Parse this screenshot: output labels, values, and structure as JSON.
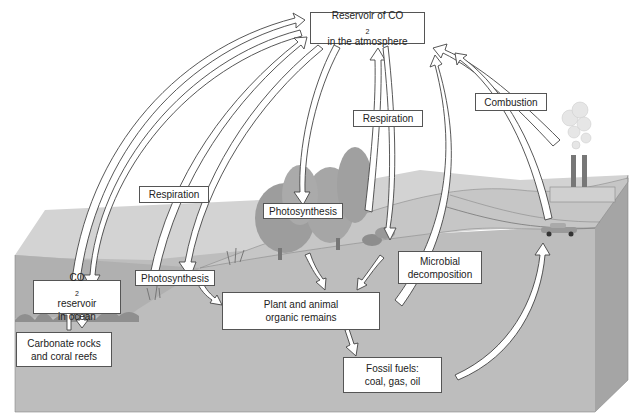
{
  "diagram": {
    "colors": {
      "background": "#ffffff",
      "ground_top": "#cfcfcf",
      "ground_front": "#bdbdbd",
      "ground_side": "#a9a9a9",
      "ocean": "#b3b3b3",
      "trees": "#9a9a9a",
      "arrow_fill": "#ffffff",
      "arrow_stroke": "#444444",
      "label_border": "#555555"
    },
    "labels": {
      "atmosphere": {
        "line1_prefix": "Reservoir of CO",
        "line1_sub": "2",
        "line2": "in the atmosphere"
      },
      "ocean": {
        "line1_prefix": "CO",
        "line1_sub": "2",
        "line1_suffix": " reservoir",
        "line2": "in ocean"
      },
      "carbonate": {
        "line1": "Carbonate rocks",
        "line2": "and coral reefs"
      },
      "respiration_left": "Respiration",
      "respiration_right": "Respiration",
      "photosynthesis_land": "Photosynthesis",
      "photosynthesis_ocean": "Photosynthesis",
      "combustion": "Combustion",
      "microbial": {
        "line1": "Microbial",
        "line2": "decomposition"
      },
      "organic": {
        "line1": "Plant and animal",
        "line2": "organic remains"
      },
      "fossil": {
        "line1": "Fossil fuels:",
        "line2": "coal, gas, oil"
      }
    }
  }
}
